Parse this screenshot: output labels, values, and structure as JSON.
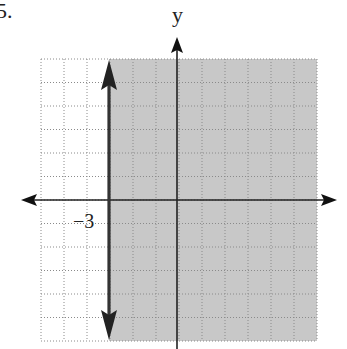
{
  "problem": {
    "number": "5."
  },
  "chart_data": {
    "type": "inequality-graph",
    "title": "",
    "inequality": "x > -3",
    "boundary": {
      "type": "vertical-line",
      "x": -3,
      "style": "solid",
      "arrows": "both"
    },
    "shaded_region": "x >= -3 (right of boundary)",
    "xlim": [
      -6,
      6
    ],
    "ylim": [
      -6,
      6
    ],
    "grid": true,
    "grid_step": 1,
    "xlabel": "",
    "ylabel": "y",
    "tick_labels": [
      {
        "axis": "x",
        "value": -3,
        "text": "−3"
      }
    ],
    "colors": {
      "shade": "#c8c8c8",
      "boundary": "#333333",
      "axes": "#111111",
      "grid": "#888888"
    }
  },
  "labels": {
    "y_axis": "y",
    "x_tick": "−3"
  }
}
